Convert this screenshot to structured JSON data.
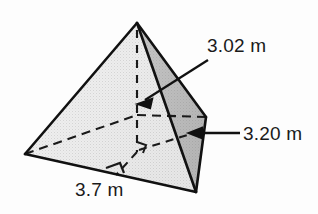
{
  "figure": {
    "name": "square-pyramid",
    "background_color": "#fdfdfd",
    "outline_color": "#1a1a1a",
    "faces": {
      "left_face_color": "#d9d9d9",
      "front_face_color": "#c6c6c6",
      "right_face_color": "#9b9b9b",
      "base_edge_color": "#1a1a1a"
    }
  },
  "labels": {
    "height": {
      "text": "3.02 m",
      "value": 3.02,
      "unit": "m",
      "measures": "pyramid-height"
    },
    "slant": {
      "text": "3.20 m",
      "value": 3.2,
      "unit": "m",
      "measures": "slant-height"
    },
    "base": {
      "text": "3.7 m",
      "value": 3.7,
      "unit": "m",
      "measures": "base-edge-length"
    }
  },
  "markers": {
    "right_angle": "right-angle-mark-at-base-of-slant-height"
  }
}
